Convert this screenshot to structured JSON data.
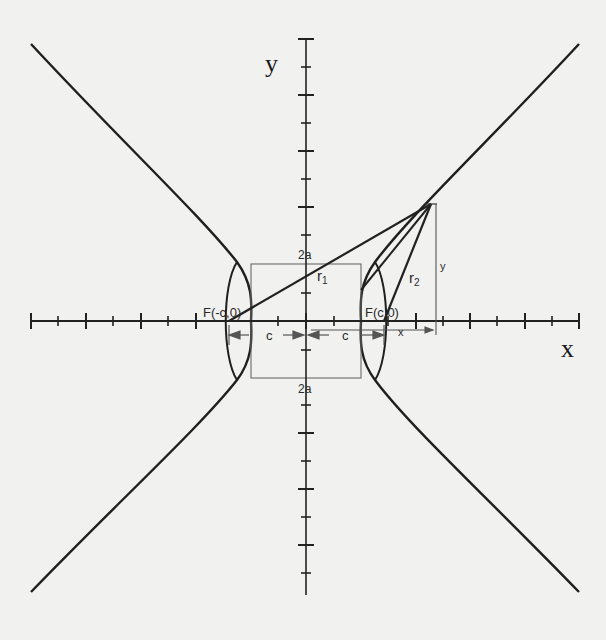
{
  "diagram": {
    "type": "hyperbola-focal-construction",
    "axis_labels": {
      "x": "x",
      "y": "y"
    },
    "labels": {
      "focus_left": "F(-c,0)",
      "focus_right": "F(c,0)",
      "two_a_top": "2a",
      "two_a_bottom": "2a",
      "r1": "r",
      "r1_sub": "1",
      "r2": "r",
      "r2_sub": "2",
      "c_left": "c",
      "c_right": "c",
      "x_dim": "x",
      "y_dim": "y"
    },
    "colors": {
      "background": "#f1f1ef",
      "curve": "#1f1f1f",
      "axis": "#222222",
      "construction": "#555555"
    }
  }
}
